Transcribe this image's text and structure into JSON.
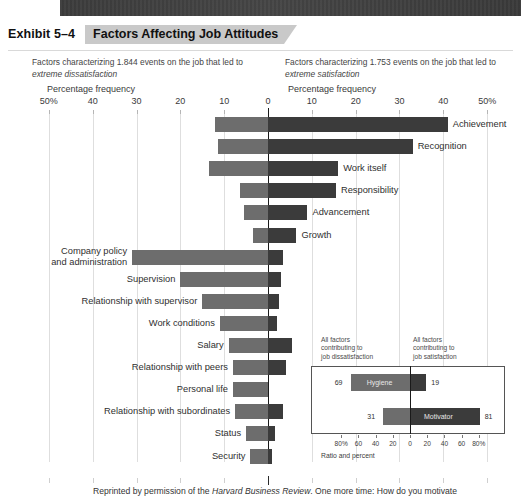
{
  "exhibit": {
    "number": "Exhibit 5–4",
    "title": "Factors Affecting Job Attitudes"
  },
  "captions": {
    "left_line1": "Factors characterizing 1.844 events on the job that led to",
    "left_line2_italic": "extreme dissatisfaction",
    "right_line1": "Factors characterizing 1.753 events on the job that led to",
    "right_line2_italic": "extreme satisfaction",
    "axis_title_left": "Percentage frequency",
    "axis_title_right": "Percentage frequency"
  },
  "footnote": {
    "part1": "Reprinted by permission of the ",
    "italic": "Harvard Business Review",
    "part2": ". One more time: How do you motivate"
  },
  "chart_data": {
    "type": "bar",
    "orientation": "horizontal-diverging",
    "title": "Factors Affecting Job Attitudes",
    "xlabel": "Percentage frequency",
    "ylabel": "",
    "xlim": [
      -50,
      50
    ],
    "grid": true,
    "tick_labels": [
      "50%",
      "40",
      "30",
      "20",
      "10",
      "0",
      "10",
      "20",
      "30",
      "40",
      "50%"
    ],
    "tick_values": [
      -50,
      -40,
      -30,
      -20,
      -10,
      0,
      10,
      20,
      30,
      40,
      50
    ],
    "series": [
      {
        "name": "Satisfaction (motivators)",
        "color": "#3b3b3b",
        "side": "right"
      },
      {
        "name": "Dissatisfaction (hygiene)",
        "color": "#6d6d6d",
        "side": "left"
      }
    ],
    "categories": [
      {
        "label": "Achievement",
        "label_side": "right",
        "satisfaction": 41.0,
        "dissatisfaction": 12.0
      },
      {
        "label": "Recognition",
        "label_side": "right",
        "satisfaction": 33.0,
        "dissatisfaction": 11.5
      },
      {
        "label": "Work itself",
        "label_side": "right",
        "satisfaction": 16.0,
        "dissatisfaction": 13.5
      },
      {
        "label": "Responsibility",
        "label_side": "right",
        "satisfaction": 15.5,
        "dissatisfaction": 6.5
      },
      {
        "label": "Advancement",
        "label_side": "right",
        "satisfaction": 9.0,
        "dissatisfaction": 5.5
      },
      {
        "label": "Growth",
        "label_side": "right",
        "satisfaction": 6.5,
        "dissatisfaction": 3.5
      },
      {
        "label": "Company policy\nand administration",
        "label_side": "left",
        "satisfaction": 3.5,
        "dissatisfaction": 31.0
      },
      {
        "label": "Supervision",
        "label_side": "left",
        "satisfaction": 3.0,
        "dissatisfaction": 20.0
      },
      {
        "label": "Relationship with supervisor",
        "label_side": "left",
        "satisfaction": 2.5,
        "dissatisfaction": 15.0
      },
      {
        "label": "Work conditions",
        "label_side": "left",
        "satisfaction": 2.0,
        "dissatisfaction": 11.0
      },
      {
        "label": "Salary",
        "label_side": "left",
        "satisfaction": 5.5,
        "dissatisfaction": 9.0
      },
      {
        "label": "Relationship with peers",
        "label_side": "left",
        "satisfaction": 4.0,
        "dissatisfaction": 8.0
      },
      {
        "label": "Personal life",
        "label_side": "left",
        "satisfaction": 0.0,
        "dissatisfaction": 8.0
      },
      {
        "label": "Relationship with subordinates",
        "label_side": "left",
        "satisfaction": 3.5,
        "dissatisfaction": 7.5
      },
      {
        "label": "Status",
        "label_side": "left",
        "satisfaction": 1.5,
        "dissatisfaction": 5.0
      },
      {
        "label": "Security",
        "label_side": "left",
        "satisfaction": 1.0,
        "dissatisfaction": 4.0
      }
    ]
  },
  "inset": {
    "caption_left": "All factors\ncontributing to\njob dissatisfaction",
    "caption_right": "All factors\ncontributing to\njob satisfaction",
    "axis_caption": "Ratio and percent",
    "tick_labels": [
      "80%",
      "60",
      "40",
      "20",
      "0",
      "20",
      "40",
      "60",
      "80%"
    ],
    "tick_values": [
      -80,
      -60,
      -40,
      -20,
      0,
      20,
      40,
      60,
      80
    ],
    "chart_data": {
      "type": "bar",
      "orientation": "horizontal-diverging",
      "xlim": [
        -90,
        90
      ],
      "bars": [
        {
          "label": "Hygiene",
          "left_value": 69,
          "right_value": 19,
          "left_color": "#6d6d6d",
          "right_color": "#3b3b3b"
        },
        {
          "label": "Motivator",
          "left_value": 31,
          "right_value": 81,
          "left_color": "#6d6d6d",
          "right_color": "#3b3b3b"
        }
      ]
    }
  }
}
